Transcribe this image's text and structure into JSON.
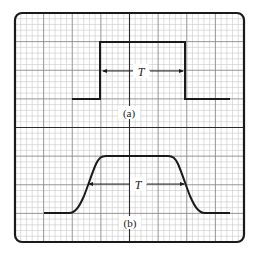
{
  "figure": {
    "frame": {
      "x": 15,
      "y": 13,
      "width": 229,
      "height": 229,
      "corner_radius": 7,
      "stroke": "#1a1a1a"
    },
    "grid": {
      "major_divisions": 8,
      "minor_per_major": 5,
      "minor_color": "#c8c8c8",
      "major_color": "#8a8a8a",
      "center_color": "#2a2a2a"
    },
    "waveform_color": "#1a1a1a"
  },
  "panels": [
    {
      "id": "a",
      "label": "(a)",
      "description": "Ideal rectangular pulse",
      "period_label": "T",
      "label_pos": {
        "x": 128,
        "y": 114
      },
      "period_label_pos": {
        "x": 141,
        "y": 75
      },
      "arrow": {
        "x1": 103,
        "x2": 183,
        "y": 71
      }
    },
    {
      "id": "b",
      "label": "(b)",
      "description": "Pulse with finite rise and fall times",
      "period_label": "T",
      "label_pos": {
        "x": 130,
        "y": 225
      },
      "period_label_pos": {
        "x": 138,
        "y": 189
      },
      "arrow": {
        "x1": 88,
        "x2": 183,
        "y": 184
      }
    }
  ]
}
